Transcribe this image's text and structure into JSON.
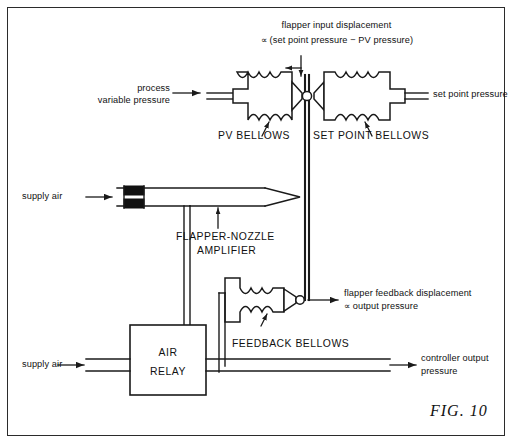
{
  "figure": {
    "number_label": "FIG.  10",
    "title_text_top_line1": "flapper input displacement",
    "title_text_top_line2": "∝ (set point pressure − PV pressure)"
  },
  "annotations": {
    "flapper_input_l1": "flapper input displacement",
    "flapper_input_l2": "∝ (set point pressure − PV pressure)",
    "process_variable_l1": "process",
    "process_variable_l2": "variable pressure",
    "set_point_pressure": "set point pressure",
    "pv_bellows": "PV BELLOWS",
    "set_point_bellows": "SET POINT BELLOWS",
    "supply_air_top": "supply air",
    "supply_air_bottom": "supply air",
    "flapper_nozzle_l1": "FLAPPER-NOZZLE",
    "flapper_nozzle_l2": "AMPLIFIER",
    "feedback_displacement_l1": "flapper feedback displacement",
    "feedback_displacement_l2": "∝ output pressure",
    "feedback_bellows": "FEEDBACK BELLOWS",
    "air_relay_l1": "AIR",
    "air_relay_l2": "RELAY",
    "controller_output_l1": "controller output",
    "controller_output_l2": "pressure"
  },
  "icons": {
    "pv_bellows_icon": "bellows-icon",
    "set_point_bellows_icon": "bellows-icon",
    "feedback_bellows_icon": "bellows-icon",
    "flapper_rod_icon": "flapper-rod-icon",
    "pivot_icon": "pivot-circle-icon",
    "nozzle_icon": "nozzle-taper-icon",
    "restriction_icon": "orifice-restriction-icon",
    "air_relay_icon": "relay-box-icon",
    "arrow_icon": "arrow-icon",
    "leader_icon": "leader-arrow-icon"
  },
  "colors": {
    "line": "#1a1a1a",
    "frame": "#2b2b2b",
    "fill_black": "#111111",
    "background": "#ffffff"
  }
}
